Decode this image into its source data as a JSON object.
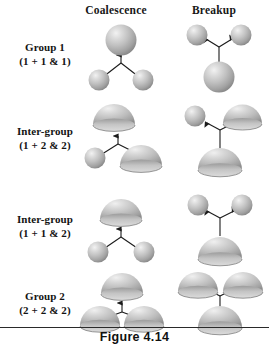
{
  "figure": {
    "caption": "Figure 4.14",
    "columns": [
      {
        "id": "coalescence",
        "label": "Coalescence"
      },
      {
        "id": "breakup",
        "label": "Breakup"
      }
    ],
    "rows": [
      {
        "id": "group-1",
        "label_line1": "Group 1",
        "label_line2": "(1 + 1 & 1)",
        "coalescence": {
          "arrow_direction": "up",
          "inputs": [
            "sphere",
            "sphere"
          ],
          "output": "sphere"
        },
        "breakup": {
          "arrow_direction": "outward-up",
          "input": "sphere",
          "outputs": [
            "sphere",
            "sphere"
          ]
        }
      },
      {
        "id": "inter-group-1-2-2",
        "label_line1": "Inter-group",
        "label_line2": "(1 + 2 & 2)",
        "coalescence": {
          "arrow_direction": "up",
          "inputs": [
            "sphere",
            "dome"
          ],
          "output": "dome"
        },
        "breakup": {
          "arrow_direction": "outward-up",
          "input": "dome",
          "outputs": [
            "sphere",
            "dome"
          ]
        }
      },
      {
        "id": "inter-group-1-1-2",
        "label_line1": "Inter-group",
        "label_line2": "(1 + 1 & 2)",
        "coalescence": {
          "arrow_direction": "up",
          "inputs": [
            "sphere",
            "sphere"
          ],
          "output": "dome"
        },
        "breakup": {
          "arrow_direction": "outward-up",
          "input": "dome",
          "outputs": [
            "sphere",
            "sphere"
          ]
        }
      },
      {
        "id": "group-2",
        "label_line1": "Group 2",
        "label_line2": "(2 + 2 & 2)",
        "coalescence": {
          "arrow_direction": "up",
          "inputs": [
            "dome",
            "dome"
          ],
          "output": "dome"
        },
        "breakup": {
          "arrow_direction": "outward-up",
          "input": "dome",
          "outputs": [
            "dome",
            "dome"
          ]
        }
      }
    ],
    "colors": {
      "background": "#ffffff",
      "text": "#141414",
      "particle_light": "#e9e9e9",
      "particle_mid": "#b9b9b9",
      "particle_dark": "#8e8e8e",
      "particle_edge": "#6f6f6f",
      "connector": "#1b1b1b",
      "rule": "#2a2a2a"
    }
  }
}
